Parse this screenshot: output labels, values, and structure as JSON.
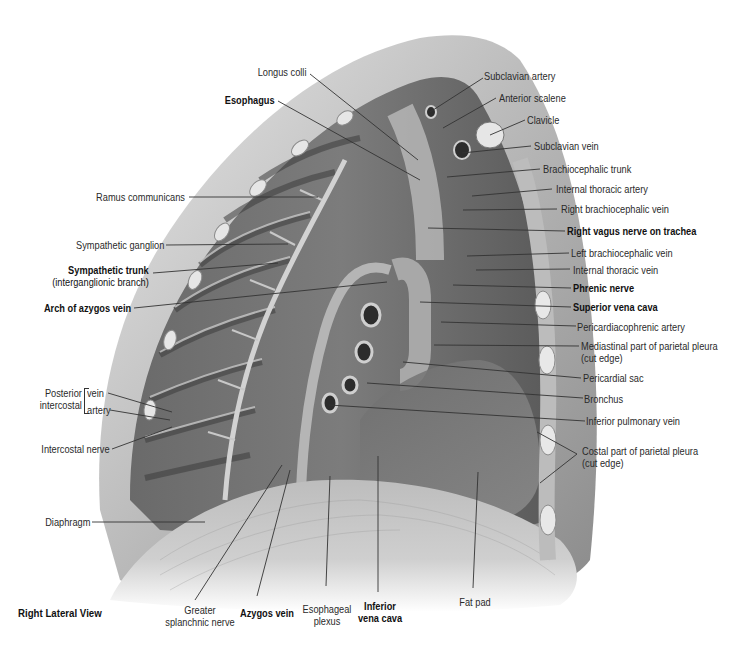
{
  "figure": {
    "view_label": "Right Lateral View",
    "colors": {
      "background": "#ffffff",
      "label_text": "#2a2a2a",
      "leader_line": "#333333",
      "tissue_light": "#d9d9d9",
      "tissue_mid": "#9a9a9a",
      "tissue_dark": "#4a4a4a"
    }
  },
  "labels": {
    "top": {
      "longus_colli": "Longus colli",
      "esophagus": "Esophagus"
    },
    "left": {
      "ramus_communicans": "Ramus communicans",
      "sympathetic_ganglion": "Sympathetic ganglion",
      "sympathetic_trunk": "Sympathetic trunk",
      "sympathetic_trunk_sub": "(interganglionic branch)",
      "arch_of_azygos_vein": "Arch of azygos vein",
      "posterior": "Posterior",
      "intercostal": "intercostal",
      "vein": "vein",
      "artery": "artery",
      "intercostal_nerve": "Intercostal nerve",
      "diaphragm": "Diaphragm"
    },
    "right": {
      "subclavian_artery": "Subclavian artery",
      "anterior_scalene": "Anterior scalene",
      "clavicle": "Clavicle",
      "subclavian_vein": "Subclavian vein",
      "brachiocephalic_trunk": "Brachiocephalic trunk",
      "internal_thoracic_artery": "Internal thoracic artery",
      "right_brachiocephalic_vein": "Right brachiocephalic vein",
      "right_vagus_nerve": "Right vagus nerve on trachea",
      "left_brachiocephalic_vein": "Left brachiocephalic vein",
      "internal_thoracic_vein": "Internal thoracic vein",
      "phrenic_nerve": "Phrenic nerve",
      "superior_vena_cava": "Superior vena cava",
      "pericardiacophrenic_artery": "Pericardiacophrenic artery",
      "mediastinal_pleura": "Mediastinal part of parietal pleura",
      "mediastinal_pleura_sub": "(cut edge)",
      "pericardial_sac": "Pericardial sac",
      "bronchus": "Bronchus",
      "inferior_pulmonary_vein": "Inferior pulmonary vein",
      "costal_pleura": "Costal part of parietal pleura",
      "costal_pleura_sub": "(cut edge)"
    },
    "bottom": {
      "greater_splanchnic_1": "Greater",
      "greater_splanchnic_2": "splanchnic nerve",
      "azygos_vein": "Azygos vein",
      "esophageal_plexus_1": "Esophageal",
      "esophageal_plexus_2": "plexus",
      "inferior_vena_cava_1": "Inferior",
      "inferior_vena_cava_2": "vena cava",
      "fat_pad": "Fat pad"
    }
  }
}
